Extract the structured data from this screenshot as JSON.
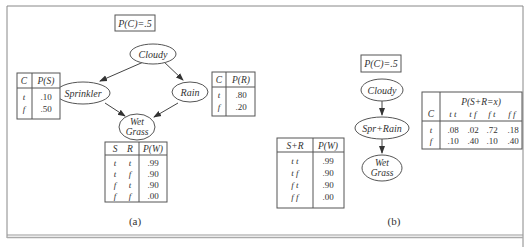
{
  "panel_a": {
    "label": "(a)",
    "prior_box": "P(C)=.5",
    "nodes": {
      "cloudy": "Cloudy",
      "sprinkler": "Sprinkler",
      "rain": "Rain",
      "wet1": "Wet",
      "wet2": "Grass"
    },
    "cpt_s": {
      "headers": [
        "C",
        "P(S)"
      ],
      "rows": [
        [
          "t",
          ".10"
        ],
        [
          "f",
          ".50"
        ]
      ]
    },
    "cpt_r": {
      "headers": [
        "C",
        "P(R)"
      ],
      "rows": [
        [
          "t",
          ".80"
        ],
        [
          "f",
          ".20"
        ]
      ]
    },
    "cpt_w": {
      "headers": [
        "S",
        "R",
        "P(W)"
      ],
      "rows": [
        [
          "t",
          "t",
          ".99"
        ],
        [
          "t",
          "f",
          ".90"
        ],
        [
          "f",
          "t",
          ".90"
        ],
        [
          "f",
          "f",
          ".00"
        ]
      ]
    }
  },
  "panel_b": {
    "label": "(b)",
    "prior_box": "P(C)=.5",
    "nodes": {
      "cloudy": "Cloudy",
      "spr_rain": "Spr+Rain",
      "wet1": "Wet",
      "wet2": "Grass"
    },
    "cpt_w": {
      "headers": [
        "S+R",
        "P(W)"
      ],
      "rows": [
        [
          "t t",
          ".99"
        ],
        [
          "t f",
          ".90"
        ],
        [
          "f t",
          ".90"
        ],
        [
          "f f",
          ".00"
        ]
      ]
    },
    "cpt_sr": {
      "title": "P(S+R=x)",
      "c_header": "C",
      "cols": [
        "t t",
        "t f",
        "f t",
        "f f"
      ],
      "rows": [
        {
          "c": "t",
          "vals": [
            ".08",
            ".02",
            ".72",
            ".18"
          ]
        },
        {
          "c": "f",
          "vals": [
            ".10",
            ".40",
            ".10",
            ".40"
          ]
        }
      ]
    }
  }
}
